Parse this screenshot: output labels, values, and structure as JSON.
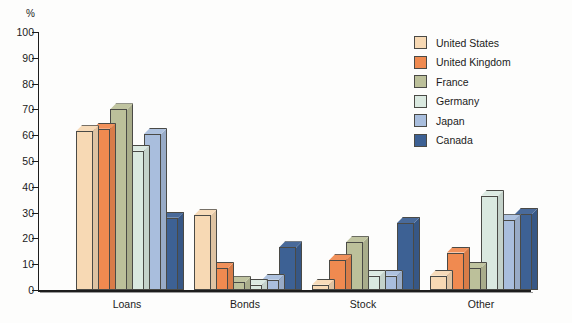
{
  "chart_data": {
    "type": "bar",
    "title": "",
    "xlabel": "",
    "ylabel": "%",
    "ylim": [
      0,
      100
    ],
    "yticks": [
      0,
      10,
      20,
      30,
      40,
      50,
      60,
      70,
      80,
      90,
      100
    ],
    "ytick_labels": [
      "0",
      "10",
      "20",
      "30",
      "40",
      "50",
      "60",
      "70",
      "80",
      "90",
      "100"
    ],
    "grid": false,
    "legend_position": "upper right",
    "categories": [
      "Loans",
      "Bonds",
      "Stock",
      "Other"
    ],
    "series": [
      {
        "name": "United States",
        "color": "#f7d9b4",
        "values": [
          61.5,
          29.0,
          2.0,
          5.5
        ]
      },
      {
        "name": "United Kingdom",
        "color": "#f08a50",
        "values": [
          62.5,
          8.5,
          11.5,
          14.5
        ]
      },
      {
        "name": "France",
        "color": "#bcc09a",
        "values": [
          70.0,
          3.0,
          18.5,
          8.5
        ]
      },
      {
        "name": "Germany",
        "color": "#dae9e0",
        "values": [
          54.0,
          2.0,
          5.5,
          36.5
        ]
      },
      {
        "name": "Japan",
        "color": "#a9bedd",
        "values": [
          60.5,
          4.0,
          5.5,
          27.0
        ]
      },
      {
        "name": "Canada",
        "color": "#3d6194",
        "values": [
          28.0,
          16.5,
          26.0,
          29.5
        ]
      }
    ]
  },
  "axis": {
    "unit_label": "%"
  }
}
